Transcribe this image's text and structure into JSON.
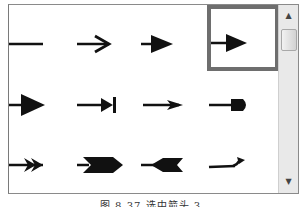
{
  "panel": {
    "title": "Arrow style gallery",
    "selected_index": 3,
    "items": [
      {
        "name": "line-no-arrow",
        "row": 0,
        "col": 0
      },
      {
        "name": "open-arrow",
        "row": 0,
        "col": 1
      },
      {
        "name": "solid-triangle-arrow",
        "row": 0,
        "col": 2
      },
      {
        "name": "solid-triangle-arrow-selected",
        "row": 0,
        "col": 3
      },
      {
        "name": "large-triangle-arrow",
        "row": 1,
        "col": 0
      },
      {
        "name": "triangle-bar-arrow",
        "row": 1,
        "col": 1
      },
      {
        "name": "stealth-arrow",
        "row": 1,
        "col": 2
      },
      {
        "name": "round-head-arrow",
        "row": 1,
        "col": 3
      },
      {
        "name": "double-chevron-arrow",
        "row": 2,
        "col": 0
      },
      {
        "name": "wide-notched-arrow",
        "row": 2,
        "col": 1
      },
      {
        "name": "reverse-notched-arrow",
        "row": 2,
        "col": 2
      },
      {
        "name": "curved-hook-arrow",
        "row": 2,
        "col": 3
      }
    ]
  },
  "scrollbar": {
    "up_glyph": "▲",
    "down_glyph": "▼"
  },
  "caption": "图 8.37  选中箭头 3",
  "colors": {
    "selection_border": "#6e6e6e",
    "arrow": "#111111",
    "scrollbar_bg": "#e9e9e9"
  }
}
